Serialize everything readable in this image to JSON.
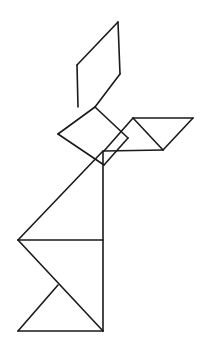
{
  "figure": {
    "background_color": "#ffffff",
    "stroke_color": "#1a1a1a",
    "stroke_width": 1.6,
    "canvas": {
      "width": 201,
      "height": 346
    }
  },
  "pieces": [
    {
      "id": "piece-parallelogram-ear",
      "name": "parallelogram",
      "label": "ear",
      "points": "118,22 120,74 78,107 77,65"
    },
    {
      "id": "piece-square-head",
      "name": "square",
      "label": "head",
      "points": "95,107 128,138 104,165 58,134"
    },
    {
      "id": "piece-small-triangle-arm-upper",
      "name": "small-triangle",
      "label": "upper-arm",
      "points": "133,118 163,150 104,151"
    },
    {
      "id": "piece-medium-triangle-arm-outer",
      "name": "medium-triangle",
      "label": "outer-arm",
      "points": "133,118 193,118 163,150"
    },
    {
      "id": "piece-large-triangle-body",
      "name": "large-triangle",
      "label": "body",
      "points": "103,151 103,240 18,240"
    },
    {
      "id": "piece-large-triangle-haunch",
      "name": "large-triangle",
      "label": "haunch",
      "points": "103,240 103,331 18,240"
    },
    {
      "id": "piece-medium-triangle-foot",
      "name": "medium-triangle",
      "label": "foot",
      "points": "18,331 103,331 58,285"
    }
  ],
  "edges": [
    {
      "name": "ear-top-left-edge",
      "points": "77,65 118,22"
    },
    {
      "name": "ear-right-edge",
      "points": "118,22 120,74"
    },
    {
      "name": "ear-bottom-right-edge",
      "points": "120,74 95,107"
    },
    {
      "name": "ear-left-edge",
      "points": "77,65 78,107"
    },
    {
      "name": "head-upper-left-edge",
      "points": "58,134 95,107"
    },
    {
      "name": "head-upper-right-edge",
      "points": "95,107 128,138"
    },
    {
      "name": "head-lower-right-edge",
      "points": "128,138 104,165"
    },
    {
      "name": "head-lower-left-edge",
      "points": "104,165 58,134"
    },
    {
      "name": "arm-top-edge",
      "points": "133,118 193,118"
    },
    {
      "name": "arm-left-edge",
      "points": "133,118 104,151"
    },
    {
      "name": "arm-inner-diagonal",
      "points": "133,118 163,150"
    },
    {
      "name": "arm-outer-diagonal",
      "points": "193,118 163,150"
    },
    {
      "name": "arm-bottom-edge",
      "points": "104,151 163,150"
    },
    {
      "name": "body-vertical-edge",
      "points": "103,151 103,331"
    },
    {
      "name": "body-upper-diagonal",
      "points": "103,151 18,240"
    },
    {
      "name": "waist-horizontal-edge",
      "points": "18,240 103,240"
    },
    {
      "name": "haunch-diagonal",
      "points": "18,240 103,331"
    },
    {
      "name": "foot-left-diagonal",
      "points": "18,331 58,285"
    },
    {
      "name": "foot-bottom-edge",
      "points": "18,331 103,331"
    }
  ]
}
